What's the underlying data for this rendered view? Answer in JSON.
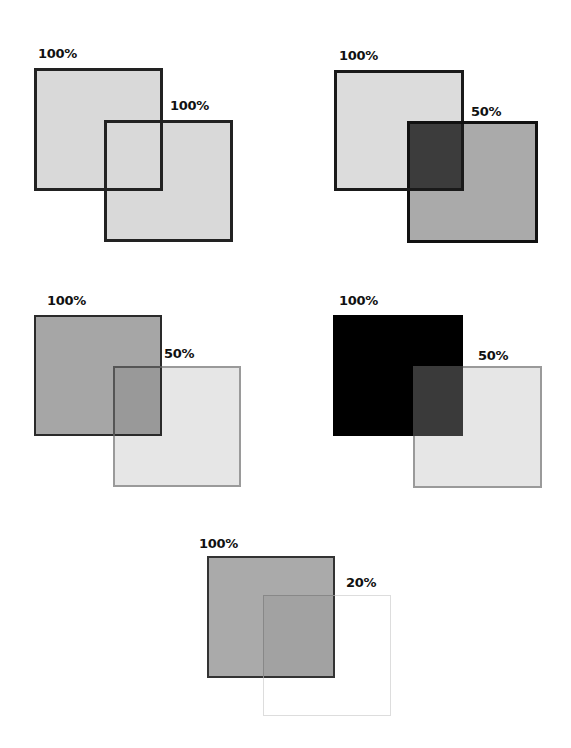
{
  "diagram": {
    "panels": [
      {
        "id": "panel-1",
        "label_a": "100%",
        "label_b": "100%",
        "square_a": {
          "opacity_label": "100%",
          "fill": "#d9d9d9",
          "border": "#222222"
        },
        "square_b": {
          "opacity_label": "100%",
          "fill": "#d9d9d9",
          "border": "#222222"
        }
      },
      {
        "id": "panel-2",
        "label_a": "100%",
        "label_b": "50%",
        "square_a": {
          "opacity_label": "100%",
          "fill": "#dcdcdc",
          "border": "#1a1a1a"
        },
        "square_b": {
          "opacity_label": "50%",
          "fill": "#aaaaaa",
          "border": "#111111"
        },
        "overlap_fill": "#3c3c3c"
      },
      {
        "id": "panel-3",
        "label_a": "100%",
        "label_b": "50%",
        "square_a": {
          "opacity_label": "100%",
          "fill": "#a6a6a6",
          "border": "#2a2a2a"
        },
        "square_b": {
          "opacity_label": "50%",
          "fill": "#e6e6e6",
          "border": "#9a9a9a"
        },
        "overlap_fill": "#999999"
      },
      {
        "id": "panel-4",
        "label_a": "100%",
        "label_b": "50%",
        "square_a": {
          "opacity_label": "100%",
          "fill": "#000000",
          "border": "#000000"
        },
        "square_b": {
          "opacity_label": "50%",
          "fill": "#e6e6e6",
          "border": "#9a9a9a"
        },
        "overlap_fill": "#3a3a3a"
      },
      {
        "id": "panel-5",
        "label_a": "100%",
        "label_b": "20%",
        "square_a": {
          "opacity_label": "100%",
          "fill": "#aaaaaa",
          "border": "#333333"
        },
        "square_b": {
          "opacity_label": "20%",
          "fill": "#ffffff",
          "border": "#dddddd"
        },
        "overlap_fill": "#a2a2a2"
      }
    ]
  }
}
